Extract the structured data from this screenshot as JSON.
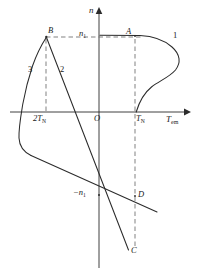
{
  "figure": {
    "axes": {
      "y_axis_label": "n",
      "x_axis_label": "T",
      "x_axis_label_sub": "em",
      "origin_label": "O"
    },
    "tick_labels": [
      {
        "id": "two-tn",
        "text": "2T",
        "sub": "N",
        "x": 37,
        "y": 110
      },
      {
        "id": "tn",
        "text": "T",
        "sub": "N",
        "x": 136,
        "y": 111
      },
      {
        "id": "n1",
        "text": "n",
        "sub": "1",
        "x": 79,
        "y": 30
      },
      {
        "id": "minus-n1",
        "text": "−n",
        "sub": "1",
        "x": 76,
        "y": 186
      }
    ],
    "point_labels": [
      {
        "id": "point-a",
        "text": "A",
        "x": 127,
        "y": 28
      },
      {
        "id": "point-b",
        "text": "B",
        "x": 47,
        "y": 27
      },
      {
        "id": "point-c",
        "text": "C",
        "x": 131,
        "y": 245
      },
      {
        "id": "point-d",
        "text": "D",
        "x": 138,
        "y": 190
      }
    ],
    "curve_labels": [
      {
        "id": "curve-1",
        "text": "1",
        "x": 174,
        "y": 32
      },
      {
        "id": "curve-2",
        "text": "2",
        "x": 61,
        "y": 66
      },
      {
        "id": "curve-3",
        "text": "3",
        "x": 30,
        "y": 66
      }
    ],
    "geometry": {
      "x_axis_y": 112,
      "y_axis_x": 99,
      "x_axis_start": 10,
      "x_axis_end": 188,
      "y_axis_top": 8,
      "y_axis_bottom": 268,
      "n1_level_y": 37,
      "minus_n1_y": 195,
      "tn_x": 135,
      "two_tn_x": 46
    },
    "colors": {
      "stroke": "#2b2b2b",
      "dashed": "#6e6e6e",
      "background": "#ffffff",
      "text": "#1a1a1a"
    },
    "paths": {
      "curve_1": "M 140 35 C 152 36 164 40 172 47 C 180 54 181 62 176 69 C 170 76 160 80 152 85 C 144 91 139 100 136 112",
      "curve_3": "M 46 37 C 41 44 35 54 31 66 C 27 78 24 92 22 105 C 20 118 18 130 19 139 C 20 147 24 151 31 155",
      "curve_3_tail": "M 31 155 L 157 212",
      "line_2": "M 46 37 L 128 249",
      "dash_horizontal": "M 46 37 L 141 37",
      "dash_vert_2tn": "M 46 38 L 46 112",
      "dash_vert_tn": "M 135 38 L 135 250"
    }
  }
}
